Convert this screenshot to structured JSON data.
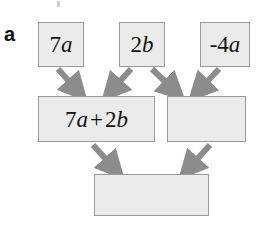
{
  "figure": {
    "panel_label": "a",
    "type": "flow-diagram",
    "background_color": "#ffffff",
    "node_fill_color": "#ebebeb",
    "node_border_color": "#9a9a9a",
    "arrow_color": "#8c8c8c",
    "text_color": "#141414"
  },
  "nodes": [
    {
      "id": "term-7a",
      "label": "7a",
      "coefficient": "7",
      "variable": "a",
      "row": "top",
      "empty": false
    },
    {
      "id": "term-2b",
      "label": "2b",
      "coefficient": "2",
      "variable": "b",
      "row": "top",
      "empty": false
    },
    {
      "id": "term-minus-4a",
      "label": "-4a",
      "coefficient": "-4",
      "variable": "a",
      "row": "top",
      "empty": false
    },
    {
      "id": "sum-7a-2b",
      "label": "7a + 2b",
      "left_term": "7a",
      "operator": "+",
      "right_term": "2b",
      "row": "middle",
      "empty": false
    },
    {
      "id": "middle-empty-box",
      "label": "",
      "row": "middle",
      "empty": true
    },
    {
      "id": "result-empty-box",
      "label": "",
      "row": "bottom",
      "empty": true
    }
  ],
  "edges": [
    {
      "from": "term-7a",
      "to": "sum-7a-2b"
    },
    {
      "from": "term-2b",
      "to": "sum-7a-2b"
    },
    {
      "from": "term-2b",
      "to": "middle-empty-box"
    },
    {
      "from": "term-minus-4a",
      "to": "middle-empty-box"
    },
    {
      "from": "sum-7a-2b",
      "to": "result-empty-box"
    },
    {
      "from": "middle-empty-box",
      "to": "result-empty-box"
    }
  ]
}
